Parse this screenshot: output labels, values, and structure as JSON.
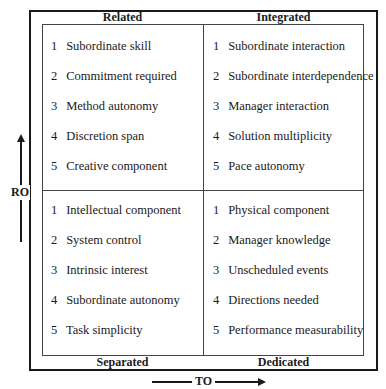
{
  "quadrants": {
    "related": {
      "label": "Related",
      "items": [
        {
          "num": "1",
          "text": "Subordinate skill"
        },
        {
          "num": "2",
          "text": "Commitment required"
        },
        {
          "num": "3",
          "text": "Method autonomy"
        },
        {
          "num": "4",
          "text": "Discretion span"
        },
        {
          "num": "5",
          "text": "Creative component"
        }
      ]
    },
    "integrated": {
      "label": "Integrated",
      "items": [
        {
          "num": "1",
          "text": "Subordinate interaction"
        },
        {
          "num": "2",
          "text": "Subordinate interdependence"
        },
        {
          "num": "3",
          "text": "Manager interaction"
        },
        {
          "num": "4",
          "text": "Solution multiplicity"
        },
        {
          "num": "5",
          "text": "Pace autonomy"
        }
      ]
    },
    "separated": {
      "label": "Separated",
      "items": [
        {
          "num": "1",
          "text": "Intellectual component"
        },
        {
          "num": "2",
          "text": "System control"
        },
        {
          "num": "3",
          "text": "Intrinsic interest"
        },
        {
          "num": "4",
          "text": "Subordinate autonomy"
        },
        {
          "num": "5",
          "text": "Task simplicity"
        }
      ]
    },
    "dedicated": {
      "label": "Dedicated",
      "items": [
        {
          "num": "1",
          "text": "Physical component"
        },
        {
          "num": "2",
          "text": "Manager knowledge"
        },
        {
          "num": "3",
          "text": "Unscheduled events"
        },
        {
          "num": "4",
          "text": "Directions needed"
        },
        {
          "num": "5",
          "text": "Performance measurability"
        }
      ]
    }
  },
  "axes": {
    "vertical": {
      "label": "RO",
      "direction": "up"
    },
    "horizontal": {
      "label": "TO",
      "direction": "right"
    }
  }
}
